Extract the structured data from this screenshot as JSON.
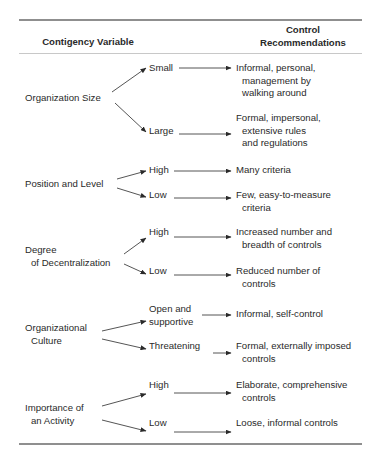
{
  "header": {
    "col1": "Contigency Variable",
    "col2_line1": "Control",
    "col2_line2": "Recommendations"
  },
  "variables": [
    {
      "label_lines": [
        "Organization Size"
      ],
      "branches": [
        {
          "level": "Small",
          "recommendation_lines": [
            "Informal, personal,",
            "management by",
            "walking around"
          ]
        },
        {
          "level": "Large",
          "recommendation_lines": [
            "Formal, impersonal,",
            "extensive rules",
            "and regulations"
          ]
        }
      ]
    },
    {
      "label_lines": [
        "Position and Level"
      ],
      "branches": [
        {
          "level": "High",
          "recommendation_lines": [
            "Many criteria"
          ]
        },
        {
          "level": "Low",
          "recommendation_lines": [
            "Few, easy-to-measure",
            "criteria"
          ]
        }
      ]
    },
    {
      "label_lines": [
        "Degree",
        "of Decentralization"
      ],
      "branches": [
        {
          "level": "High",
          "recommendation_lines": [
            "Increased number and",
            "breadth of controls"
          ]
        },
        {
          "level": "Low",
          "recommendation_lines": [
            "Reduced number of",
            "controls"
          ]
        }
      ]
    },
    {
      "label_lines": [
        "Organizational",
        "Culture"
      ],
      "branches": [
        {
          "level_lines": [
            "Open and",
            "supportive"
          ],
          "recommendation_lines": [
            "Informal, self-control"
          ]
        },
        {
          "level": "Threatening",
          "recommendation_lines": [
            "Formal, externally imposed",
            "controls"
          ]
        }
      ]
    },
    {
      "label_lines": [
        "Importance of",
        "an Activity"
      ],
      "branches": [
        {
          "level": "High",
          "recommendation_lines": [
            "Elaborate, comprehensive",
            "controls"
          ]
        },
        {
          "level": "Low",
          "recommendation_lines": [
            "Loose, informal controls"
          ]
        }
      ]
    }
  ],
  "colors": {
    "text": "#2a2a2a",
    "rule_thick": "#8f8f8f",
    "rule_thin": "#c8c8c8",
    "arrow": "#2a2a2a"
  }
}
